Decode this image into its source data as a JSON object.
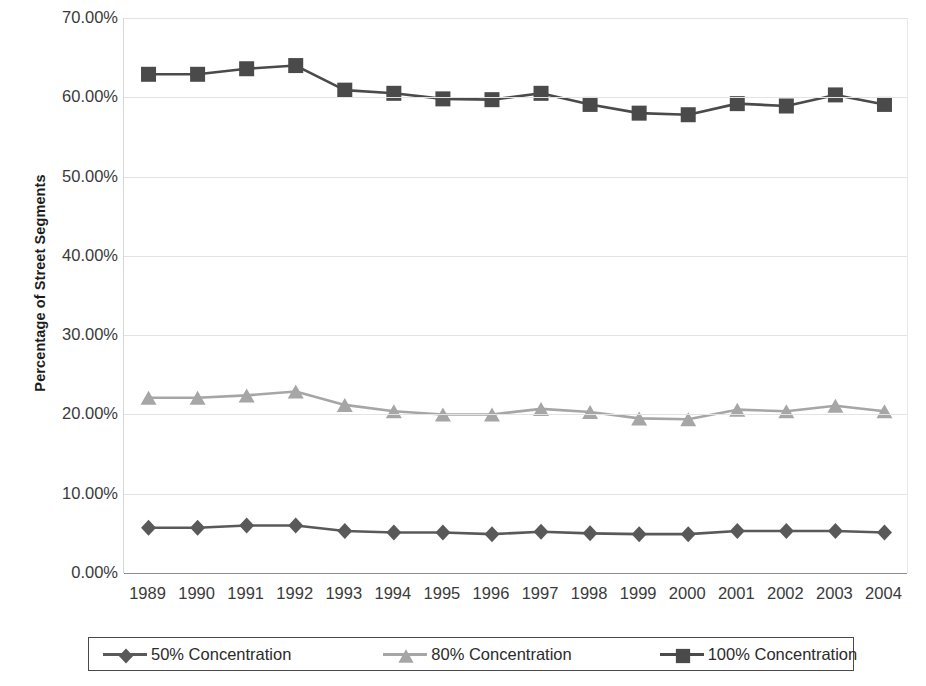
{
  "chart_data": {
    "type": "line",
    "title": "",
    "xlabel": "",
    "ylabel": "Percentage of Street Segments",
    "ylim": [
      0,
      70
    ],
    "ytick_step": 10,
    "ytick_labels": [
      "0.00%",
      "10.00%",
      "20.00%",
      "30.00%",
      "40.00%",
      "50.00%",
      "60.00%",
      "70.00%"
    ],
    "ytick_values": [
      0,
      10,
      20,
      30,
      40,
      50,
      60,
      70
    ],
    "grid": true,
    "legend_position": "bottom",
    "categories": [
      "1989",
      "1990",
      "1991",
      "1992",
      "1993",
      "1994",
      "1995",
      "1996",
      "1997",
      "1998",
      "1999",
      "2000",
      "2001",
      "2002",
      "2003",
      "2004"
    ],
    "series": [
      {
        "name": "50% Concentration",
        "marker": "diamond",
        "color": "#595959",
        "values": [
          5.7,
          5.7,
          6.0,
          6.0,
          5.3,
          5.1,
          5.1,
          4.9,
          5.2,
          5.0,
          4.9,
          4.9,
          5.3,
          5.3,
          5.3,
          5.1
        ]
      },
      {
        "name": "80% Concentration",
        "marker": "triangle",
        "color": "#a6a6a6",
        "values": [
          22.1,
          22.1,
          22.4,
          22.9,
          21.2,
          20.4,
          20.0,
          20.0,
          20.7,
          20.3,
          19.5,
          19.4,
          20.6,
          20.4,
          21.1,
          20.4
        ]
      },
      {
        "name": "100% Concentration",
        "marker": "square",
        "color": "#4a4a4a",
        "values": [
          62.9,
          62.9,
          63.6,
          64.0,
          60.9,
          60.5,
          59.8,
          59.7,
          60.5,
          59.1,
          58.0,
          57.8,
          59.2,
          58.9,
          60.3,
          59.1
        ]
      }
    ]
  },
  "legend": {
    "items": [
      {
        "label": "50% Concentration"
      },
      {
        "label": "80% Concentration"
      },
      {
        "label": "100% Concentration"
      }
    ]
  },
  "axis": {
    "y_title": "Percentage of Street Segments"
  },
  "colors": {
    "series_50": "#595959",
    "series_80": "#a6a6a6",
    "series_100": "#4a4a4a",
    "gridline": "#e3e3e3",
    "axis": "#8d8d8d",
    "text": "#2b2b2b"
  }
}
